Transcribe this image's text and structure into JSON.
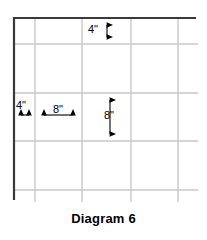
{
  "caption": "Diagram 6",
  "diagram": {
    "title": "Diagram 6",
    "border": {
      "color": "#3a3a3a",
      "top_line": {
        "x1": 13,
        "y1": 18,
        "x2": 196,
        "y2": 18
      },
      "left_line": {
        "x1": 14,
        "y1": 18,
        "x2": 14,
        "y2": 200
      }
    },
    "grid": {
      "color": "#c9c9c9",
      "vertical_lines_x": [
        35,
        82,
        131,
        178
      ],
      "horizontal_lines_y": [
        44,
        93,
        141,
        190
      ],
      "vertical_extent": {
        "y1": 18,
        "y2": 202
      },
      "horizontal_extent": {
        "x1": 14,
        "x2": 198
      }
    },
    "dimensions": [
      {
        "id": "top-margin",
        "label": "4\"",
        "orientation": "vertical",
        "value": 4,
        "unit": "inches",
        "from": {
          "x": 107,
          "y": 18
        },
        "to": {
          "x": 107,
          "y": 44
        }
      },
      {
        "id": "left-margin",
        "label": "4\"",
        "orientation": "horizontal",
        "value": 4,
        "unit": "inches",
        "from": {
          "x": 14,
          "y": 115
        },
        "to": {
          "x": 35,
          "y": 115
        }
      },
      {
        "id": "cell-width",
        "label": "8\"",
        "orientation": "horizontal",
        "value": 8,
        "unit": "inches",
        "from": {
          "x": 37,
          "y": 115
        },
        "to": {
          "x": 80,
          "y": 115
        }
      },
      {
        "id": "cell-height",
        "label": "8\"",
        "orientation": "vertical",
        "value": 8,
        "unit": "inches",
        "from": {
          "x": 110,
          "y": 93
        },
        "to": {
          "x": 110,
          "y": 141
        }
      }
    ]
  }
}
